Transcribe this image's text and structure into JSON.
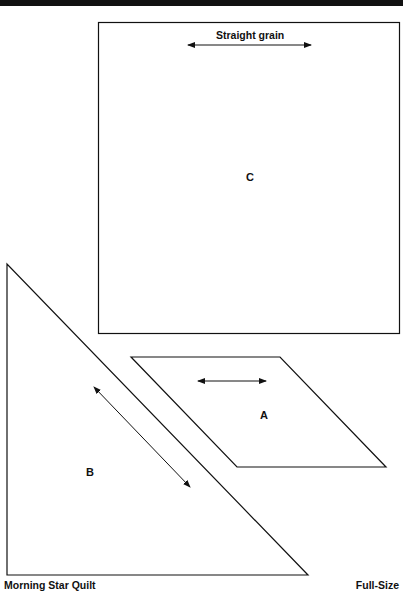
{
  "title": "Morning Star Quilt",
  "scale": "Full-Size",
  "pieces": {
    "A": {
      "label": "A",
      "shape": "parallelogram",
      "grain": "horizontal"
    },
    "B": {
      "label": "B",
      "shape": "right-triangle",
      "grain": "diagonal"
    },
    "C": {
      "label": "C",
      "shape": "square",
      "grain": "horizontal"
    }
  },
  "grain_label": "Straight grain",
  "colors": {
    "line": "#111111",
    "background": "#ffffff"
  }
}
